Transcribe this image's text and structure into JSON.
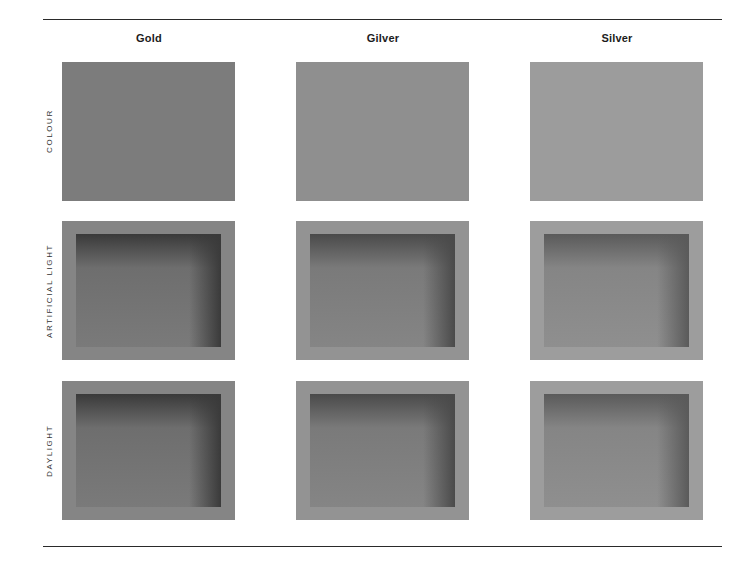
{
  "columns": [
    {
      "label": "Gold",
      "swatch": "#7c7c7c",
      "frame": "#858585",
      "recess_dark": "#3a3a3a",
      "recess_mid": "#6e6e6e",
      "recess_light": "#7a7a7a"
    },
    {
      "label": "Gilver",
      "swatch": "#8f8f8f",
      "frame": "#939393",
      "recess_dark": "#4a4a4a",
      "recess_mid": "#7a7a7a",
      "recess_light": "#858585"
    },
    {
      "label": "Silver",
      "swatch": "#9c9c9c",
      "frame": "#9d9d9d",
      "recess_dark": "#5a5a5a",
      "recess_mid": "#858585",
      "recess_light": "#8f8f8f"
    }
  ],
  "rows": [
    {
      "label": "COLOUR"
    },
    {
      "label": "ARTIFICIAL LIGHT"
    },
    {
      "label": "DAYLIGHT"
    }
  ]
}
